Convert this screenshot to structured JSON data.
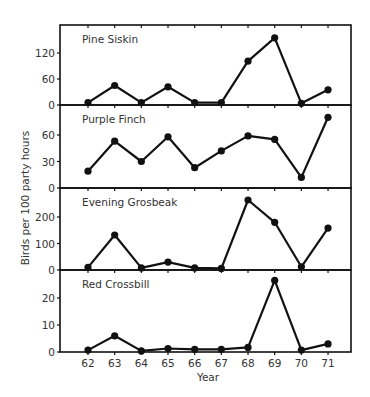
{
  "chart_data": {
    "type": "line",
    "layout": "stacked-panels",
    "xlabel": "Year",
    "ylabel": "Birds per 100 party hours",
    "x": [
      "62",
      "63",
      "64",
      "65",
      "66",
      "67",
      "68",
      "69",
      "70",
      "71"
    ],
    "grid": false,
    "legend": "none (panel titles inside each panel)",
    "series": [
      {
        "name": "Pine Siskin",
        "values": [
          2,
          45,
          2,
          42,
          2,
          2,
          101,
          155,
          4,
          35
        ],
        "yticks": [
          0,
          60,
          120
        ],
        "ylim": [
          0,
          185
        ]
      },
      {
        "name": "Purple Finch",
        "values": [
          19,
          53,
          30,
          58,
          23,
          42,
          59,
          55,
          12,
          80
        ],
        "yticks": [
          0,
          30,
          60
        ],
        "ylim": [
          0,
          90
        ]
      },
      {
        "name": "Evening Grosbeak",
        "values": [
          10,
          132,
          8,
          30,
          8,
          6,
          264,
          180,
          12,
          158
        ],
        "yticks": [
          0,
          100,
          200
        ],
        "ylim": [
          0,
          300
        ]
      },
      {
        "name": "Red Crossbill",
        "values": [
          0.7,
          6,
          0.4,
          1.3,
          1,
          1,
          1.7,
          26.5,
          0.7,
          3
        ],
        "yticks": [
          0,
          10,
          20
        ],
        "ylim": [
          0,
          30
        ]
      }
    ]
  },
  "colors": {
    "line": "#111111",
    "frame": "#111111",
    "text": "#333333",
    "background": "#ffffff"
  }
}
